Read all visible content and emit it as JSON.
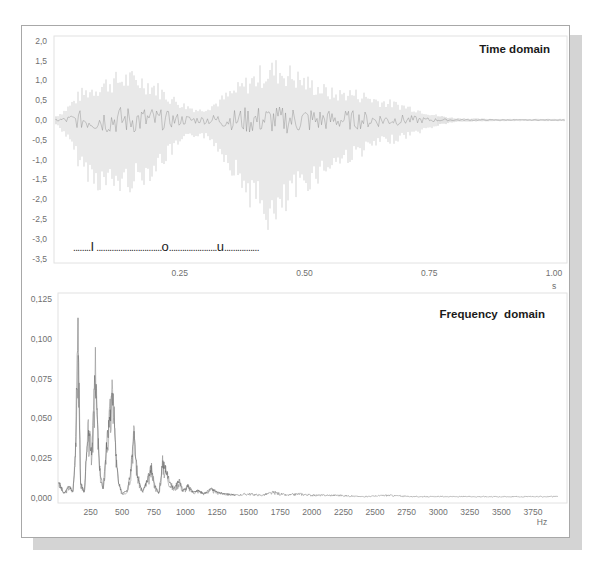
{
  "chart_data": [
    {
      "type": "line",
      "title": "Time domain",
      "xlabel": "s",
      "ylabel": "",
      "xlim": [
        0,
        1.0
      ],
      "ylim": [
        -3.5,
        2.0
      ],
      "x_ticks": [
        "0.25",
        "0.50",
        "0.75",
        "1.00"
      ],
      "x_tick_values": [
        0.25,
        0.5,
        0.75,
        1.0
      ],
      "y_ticks": [
        "2,0",
        "1,5",
        "1,0",
        "0,5",
        "0,0",
        "-0,5",
        "-1,0",
        "-1,5",
        "-2,0",
        "-2,5",
        "-3,0",
        "-3,5"
      ],
      "y_tick_values": [
        2.0,
        1.5,
        1.0,
        0.5,
        0.0,
        -0.5,
        -1.0,
        -1.5,
        -2.0,
        -2.5,
        -3.0,
        -3.5
      ],
      "grid": false,
      "annotation": {
        "text": ".........I ...........................o......................u................",
        "segments": [
          {
            "text": "........",
            "kind": "dots"
          },
          {
            "text": "I",
            "kind": "vowel"
          },
          {
            "text": " ..............................",
            "kind": "dots"
          },
          {
            "text": "o",
            "kind": "vowel"
          },
          {
            "text": "......................",
            "kind": "dots"
          },
          {
            "text": "u",
            "kind": "vowel"
          },
          {
            "text": "................",
            "kind": "dots"
          }
        ],
        "y_value": -3.3
      },
      "envelope": {
        "description": "Speech waveform amplitude envelope (upper/lower) sampled over time",
        "t": [
          0.0,
          0.02,
          0.05,
          0.08,
          0.11,
          0.14,
          0.17,
          0.2,
          0.23,
          0.26,
          0.29,
          0.32,
          0.35,
          0.38,
          0.41,
          0.44,
          0.47,
          0.5,
          0.53,
          0.56,
          0.59,
          0.62,
          0.65,
          0.68,
          0.71,
          0.74,
          0.77,
          0.8,
          0.85,
          0.9,
          0.95,
          1.0
        ],
        "upper": [
          0.1,
          0.3,
          0.8,
          1.0,
          1.2,
          1.3,
          1.25,
          1.05,
          0.7,
          0.45,
          0.3,
          0.5,
          0.8,
          1.1,
          1.4,
          1.6,
          1.45,
          1.2,
          1.0,
          0.8,
          0.85,
          0.75,
          0.6,
          0.5,
          0.4,
          0.25,
          0.12,
          0.06,
          0.04,
          0.03,
          0.03,
          0.03
        ],
        "lower": [
          -0.1,
          -0.4,
          -1.3,
          -1.8,
          -1.95,
          -1.9,
          -1.75,
          -1.45,
          -1.0,
          -0.6,
          -0.4,
          -0.7,
          -1.3,
          -2.0,
          -2.6,
          -3.1,
          -2.4,
          -1.9,
          -1.6,
          -1.3,
          -1.1,
          -0.9,
          -0.7,
          -0.6,
          -0.45,
          -0.3,
          -0.15,
          -0.06,
          -0.04,
          -0.03,
          -0.03,
          -0.03
        ]
      }
    },
    {
      "type": "line",
      "title": "Frequency  domain",
      "xlabel": "Hz",
      "ylabel": "",
      "xlim": [
        0,
        4000
      ],
      "ylim": [
        0,
        0.125
      ],
      "x_ticks": [
        "250",
        "500",
        "750",
        "1000",
        "1250",
        "1500",
        "1750",
        "2000",
        "2250",
        "2500",
        "2750",
        "3000",
        "3250",
        "3500",
        "3750"
      ],
      "x_tick_values": [
        250,
        500,
        750,
        1000,
        1250,
        1500,
        1750,
        2000,
        2250,
        2500,
        2750,
        3000,
        3250,
        3500,
        3750
      ],
      "y_ticks": [
        "0,125",
        "0,100",
        "0,075",
        "0,050",
        "0,025",
        "0,000"
      ],
      "y_tick_values": [
        0.125,
        0.1,
        0.075,
        0.05,
        0.025,
        0.0
      ],
      "grid": false,
      "spectrum": {
        "description": "Magnitude spectrum peaks (Hz, magnitude)",
        "hz": [
          0,
          40,
          80,
          110,
          130,
          150,
          170,
          200,
          230,
          260,
          285,
          300,
          320,
          350,
          380,
          410,
          430,
          450,
          470,
          500,
          540,
          570,
          590,
          620,
          660,
          700,
          730,
          760,
          790,
          820,
          850,
          880,
          910,
          950,
          980,
          1020,
          1060,
          1100,
          1150,
          1200,
          1250,
          1300,
          1400,
          1500,
          1600,
          1700,
          1800,
          1900,
          2000,
          2200,
          2400,
          2600,
          2800,
          3000,
          3200,
          3400,
          3600,
          3800,
          3950
        ],
        "mag": [
          0.01,
          0.003,
          0.008,
          0.004,
          0.03,
          0.12,
          0.01,
          0.004,
          0.045,
          0.03,
          0.09,
          0.06,
          0.02,
          0.005,
          0.04,
          0.06,
          0.075,
          0.03,
          0.01,
          0.003,
          0.005,
          0.02,
          0.047,
          0.015,
          0.004,
          0.012,
          0.02,
          0.008,
          0.003,
          0.024,
          0.018,
          0.01,
          0.006,
          0.012,
          0.005,
          0.008,
          0.004,
          0.005,
          0.003,
          0.006,
          0.004,
          0.003,
          0.002,
          0.003,
          0.002,
          0.004,
          0.002,
          0.003,
          0.002,
          0.002,
          0.001,
          0.002,
          0.001,
          0.001,
          0.001,
          0.001,
          0.001,
          0.001,
          0.001
        ]
      }
    }
  ],
  "colors": {
    "trace": "#8a8a8a",
    "shadow": "#d4d4d4",
    "frame_border": "#a8a8a8",
    "title": "#1a1a1a",
    "tick_text": "#707070"
  }
}
